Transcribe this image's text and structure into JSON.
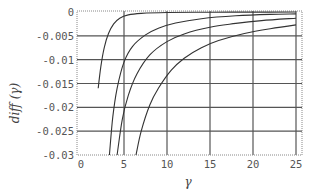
{
  "chart_data": {
    "type": "line",
    "title": "",
    "xlabel": "γ",
    "ylabel": "diff (γ)",
    "xlim": [
      0,
      25.5
    ],
    "ylim": [
      -0.03,
      0.0005
    ],
    "grid": true,
    "legend": "none",
    "x_ticks": [
      0,
      5,
      10,
      15,
      20,
      25
    ],
    "x_tick_labels": [
      "0",
      "5",
      "10",
      "15",
      "20",
      "25"
    ],
    "y_ticks": [
      0,
      -0.005,
      -0.01,
      -0.015,
      -0.02,
      -0.025,
      -0.03
    ],
    "y_tick_labels": [
      "0",
      "-0.005",
      "-0.01",
      "-0.015",
      "-0.02",
      "-0.025",
      "-0.03"
    ],
    "series": [
      {
        "name": "curve 1",
        "x": [
          2.0,
          2.3,
          2.7,
          3.2,
          3.8,
          4.5,
          5.5,
          7,
          10,
          15,
          20,
          25
        ],
        "y": [
          -0.016,
          -0.0115,
          -0.0075,
          -0.0045,
          -0.0025,
          -0.0013,
          -0.0006,
          -0.0003,
          -0.0001,
          -5e-05,
          -2e-05,
          -1e-05
        ]
      },
      {
        "name": "curve 2",
        "x": [
          3.3,
          3.7,
          4.2,
          5,
          6,
          7.5,
          9,
          11,
          14,
          18,
          22,
          25
        ],
        "y": [
          -0.03,
          -0.022,
          -0.016,
          -0.0105,
          -0.0072,
          -0.0048,
          -0.0034,
          -0.0023,
          -0.0014,
          -0.0008,
          -0.0005,
          -0.0004
        ]
      },
      {
        "name": "curve 3",
        "x": [
          4.2,
          4.8,
          5.5,
          6.5,
          8,
          10,
          12,
          15,
          18,
          21,
          25
        ],
        "y": [
          -0.03,
          -0.0225,
          -0.0175,
          -0.013,
          -0.009,
          -0.0062,
          -0.0046,
          -0.0032,
          -0.0024,
          -0.0018,
          -0.0013
        ]
      },
      {
        "name": "curve 4",
        "x": [
          6.4,
          7,
          8,
          9,
          10.5,
          12,
          14,
          16,
          19,
          22,
          25
        ],
        "y": [
          -0.03,
          -0.025,
          -0.0195,
          -0.016,
          -0.0122,
          -0.0097,
          -0.0075,
          -0.006,
          -0.0045,
          -0.0035,
          -0.0027
        ]
      }
    ],
    "colors": {
      "line": "#333333",
      "grid": "#555555",
      "frame": "#777777"
    }
  }
}
